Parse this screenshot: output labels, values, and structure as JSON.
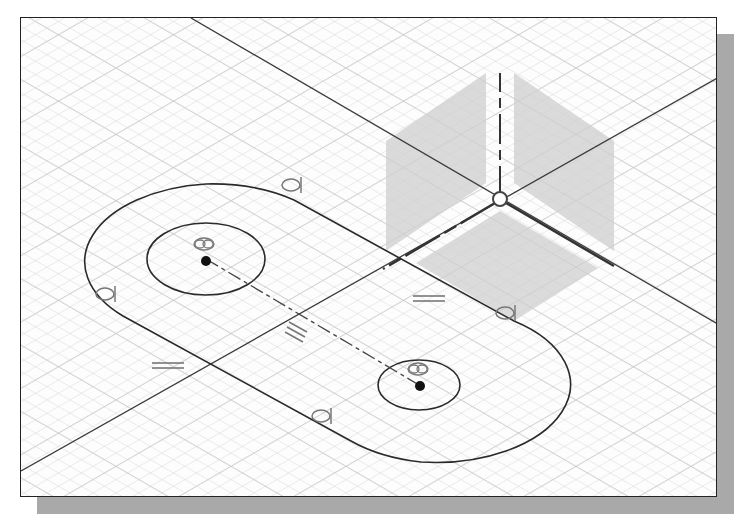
{
  "sketch": {
    "title": "CAD 2D sketch on isometric plane",
    "colors": {
      "background": "#fdfdfd",
      "grid": "#d4d4d4",
      "sketch_line": "#2a2a2a",
      "plane_shade": "#d6d6d6",
      "constraint_symbol": "#777777",
      "shadow": "#a9a9a9"
    },
    "constraints": [
      {
        "type": "tangent",
        "symbol": "tangent-icon"
      },
      {
        "type": "tangent",
        "symbol": "tangent-icon"
      },
      {
        "type": "tangent",
        "symbol": "tangent-icon"
      },
      {
        "type": "tangent",
        "symbol": "tangent-icon"
      },
      {
        "type": "concentric",
        "symbol": "concentric-icon"
      },
      {
        "type": "concentric",
        "symbol": "concentric-icon"
      },
      {
        "type": "equal",
        "symbol": "equal-icon"
      },
      {
        "type": "parallel",
        "symbol": "parallel-icon"
      },
      {
        "type": "parallel",
        "symbol": "parallel-icon"
      }
    ]
  }
}
